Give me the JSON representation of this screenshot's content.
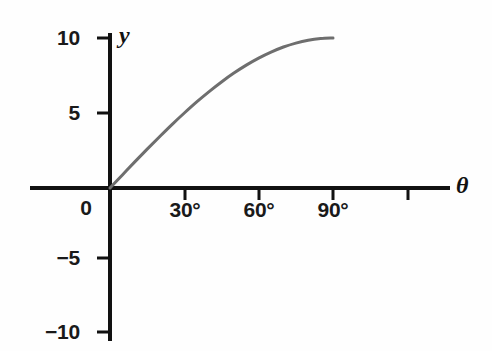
{
  "chart_data": {
    "type": "line",
    "title": "",
    "xlabel": "θ",
    "ylabel": "y",
    "grid": false,
    "legend": null,
    "xlim": [
      -32,
      136
    ],
    "ylim": [
      -10.5,
      10.2
    ],
    "x_unit": "degrees",
    "x_tick_values": [
      0,
      30,
      60,
      90,
      120
    ],
    "x_tick_labels": [
      "0",
      "30°",
      "60°",
      "90°",
      ""
    ],
    "y_tick_values": [
      10,
      5,
      -5,
      -10
    ],
    "y_tick_labels": [
      "10",
      "5",
      "−5",
      "−10"
    ],
    "series": [
      {
        "name": "y = 10 sin θ",
        "color": "#6e6e6e",
        "line_width": 3,
        "x": [
          0,
          5,
          10,
          15,
          20,
          25,
          30,
          35,
          40,
          45,
          50,
          55,
          60,
          65,
          70,
          75,
          80,
          85,
          90
        ],
        "values": [
          0,
          0.87,
          1.74,
          2.59,
          3.42,
          4.23,
          5.0,
          5.74,
          6.43,
          7.07,
          7.66,
          8.19,
          8.66,
          9.06,
          9.4,
          9.66,
          9.85,
          9.96,
          10.0
        ]
      }
    ],
    "annotations": []
  },
  "axes": {
    "y_axis_name": "y",
    "x_axis_name": "θ",
    "origin_label": "0"
  },
  "y_ticks": [
    {
      "label": "10"
    },
    {
      "label": "5"
    },
    {
      "label": "−5"
    },
    {
      "label": "−10"
    }
  ],
  "x_ticks": [
    {
      "label": "30°"
    },
    {
      "label": "60°"
    },
    {
      "label": "90°"
    }
  ]
}
